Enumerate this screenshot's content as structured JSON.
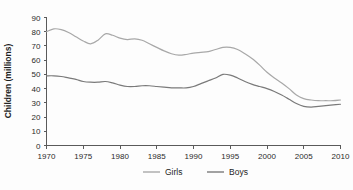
{
  "chart_data": {
    "type": "line",
    "title": "",
    "subtitle": "",
    "xlabel": "",
    "ylabel": "Children (millions)",
    "xlim": [
      1970,
      2010
    ],
    "ylim": [
      0,
      90
    ],
    "grid": false,
    "legend_position": "bottom-center",
    "x_ticks": [
      "1970",
      "1975",
      "1980",
      "1985",
      "1990",
      "1995",
      "2000",
      "2005",
      "2010"
    ],
    "y_ticks": [
      "0",
      "10",
      "20",
      "30",
      "40",
      "50",
      "60",
      "70",
      "80",
      "90"
    ],
    "x": [
      1970,
      1971,
      1972,
      1973,
      1974,
      1975,
      1976,
      1977,
      1978,
      1979,
      1980,
      1981,
      1982,
      1983,
      1984,
      1985,
      1986,
      1987,
      1988,
      1989,
      1990,
      1991,
      1992,
      1993,
      1994,
      1995,
      1996,
      1997,
      1998,
      1999,
      2000,
      2001,
      2002,
      2003,
      2004,
      2005,
      2006,
      2007,
      2008,
      2009,
      2010
    ],
    "series": [
      {
        "name": "Girls",
        "color": "#a8a8a8",
        "values": [
          80,
          82,
          81.5,
          79.5,
          76.5,
          73.5,
          71.5,
          74,
          78.5,
          77.5,
          75.5,
          74.5,
          75,
          74,
          71.5,
          69,
          66.5,
          64.5,
          63.5,
          64,
          65,
          65.5,
          66,
          67.5,
          69,
          69,
          67.5,
          64.5,
          61,
          56.5,
          51.5,
          47.5,
          44,
          40,
          35.5,
          33,
          32,
          31.5,
          31.5,
          31.5,
          32
        ]
      },
      {
        "name": "Boys",
        "color": "#7a7a7a",
        "values": [
          49,
          49,
          48.5,
          47.5,
          46.5,
          45,
          44.5,
          44.5,
          45,
          44,
          42.5,
          41.5,
          41.5,
          42,
          42,
          41.5,
          41,
          40.5,
          40.5,
          40.5,
          41.5,
          43.5,
          45.5,
          47.5,
          50,
          49.5,
          47.5,
          45,
          43,
          41.5,
          40,
          38,
          35.5,
          32.5,
          29.5,
          27.5,
          27,
          27.5,
          28,
          28.5,
          29
        ]
      }
    ]
  },
  "legend": {
    "items": [
      {
        "label": "Girls"
      },
      {
        "label": "Boys"
      }
    ]
  }
}
